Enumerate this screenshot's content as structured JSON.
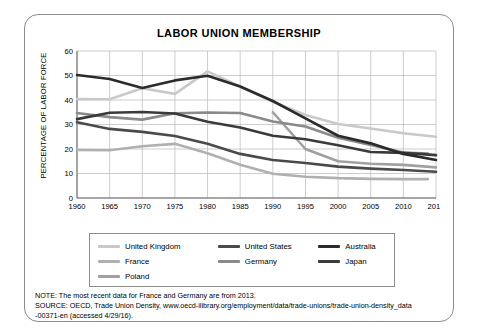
{
  "card": {
    "title": "LABOR UNION MEMBERSHIP"
  },
  "axes": {
    "ylabel": "PERCENTAGE OF LABOR FORCE"
  },
  "legend": {
    "rows": [
      [
        {
          "label": "United Kingdom",
          "color": "#c9c9c9"
        },
        {
          "label": "United States",
          "color": "#4a4a4a"
        },
        {
          "label": "Australia",
          "color": "#2b2b2b"
        }
      ],
      [
        {
          "label": "France",
          "color": "#b0b0b0"
        },
        {
          "label": "Germany",
          "color": "#8a8a8a"
        },
        {
          "label": "Japan",
          "color": "#3a3a3a"
        }
      ],
      [
        {
          "label": "Poland",
          "color": "#a0a0a0"
        }
      ]
    ]
  },
  "notes": {
    "note": "NOTE: The most recent data for France and Germany are from 2013.",
    "source": "SOURCE: OECD, Trade Union Density, www.oecd-ilibrary.org/employment/data/trade-unions/trade-union-density_data",
    "source_cont": "-00371-en (accessed 4/29/16)."
  },
  "chart_data": {
    "type": "line",
    "title": "LABOR UNION MEMBERSHIP",
    "xlabel": "",
    "ylabel": "PERCENTAGE OF LABOR FORCE",
    "xlim": [
      1960,
      2014
    ],
    "ylim": [
      0,
      60
    ],
    "yticks": [
      0,
      10,
      20,
      30,
      40,
      50,
      60
    ],
    "xticks": [
      1960,
      1965,
      1970,
      1975,
      1980,
      1985,
      1990,
      1995,
      2000,
      2005,
      2010,
      2014
    ],
    "grid": true,
    "legend_position": "bottom",
    "series": [
      {
        "name": "United Kingdom",
        "color": "#c9c9c9",
        "x": [
          1960,
          1965,
          1970,
          1975,
          1980,
          1985,
          1990,
          1995,
          2000,
          2005,
          2010,
          2014
        ],
        "values": [
          40.4,
          40.3,
          44.8,
          42.5,
          51.7,
          45.5,
          39.3,
          33.9,
          30.2,
          28.4,
          26.4,
          25.0
        ]
      },
      {
        "name": "United States",
        "color": "#4a4a4a",
        "x": [
          1960,
          1965,
          1970,
          1975,
          1980,
          1985,
          1990,
          1995,
          2000,
          2005,
          2010,
          2014
        ],
        "values": [
          30.9,
          28.2,
          27.0,
          25.3,
          22.1,
          18.0,
          15.5,
          14.3,
          12.8,
          12.0,
          11.4,
          10.7
        ]
      },
      {
        "name": "Australia",
        "color": "#2b2b2b",
        "x": [
          1960,
          1965,
          1970,
          1975,
          1980,
          1985,
          1990,
          1995,
          2000,
          2005,
          2010,
          2014
        ],
        "values": [
          50.2,
          48.6,
          44.9,
          48.0,
          49.9,
          45.5,
          39.6,
          32.5,
          25.4,
          22.3,
          18.0,
          15.5
        ]
      },
      {
        "name": "France",
        "color": "#b0b0b0",
        "x": [
          1960,
          1965,
          1970,
          1975,
          1980,
          1985,
          1990,
          1995,
          2000,
          2005,
          2010,
          2013
        ],
        "values": [
          19.6,
          19.5,
          21.1,
          22.1,
          18.3,
          13.6,
          9.9,
          8.7,
          8.1,
          7.8,
          7.7,
          7.7
        ]
      },
      {
        "name": "Germany",
        "color": "#8a8a8a",
        "x": [
          1960,
          1965,
          1970,
          1975,
          1980,
          1985,
          1990,
          1995,
          2000,
          2005,
          2010,
          2013
        ],
        "values": [
          34.7,
          33.0,
          32.0,
          34.6,
          34.9,
          34.7,
          31.2,
          29.2,
          24.6,
          21.6,
          18.6,
          18.1
        ]
      },
      {
        "name": "Japan",
        "color": "#3a3a3a",
        "x": [
          1960,
          1965,
          1970,
          1975,
          1980,
          1985,
          1990,
          1995,
          2000,
          2005,
          2010,
          2014
        ],
        "values": [
          32.2,
          34.8,
          35.1,
          34.5,
          31.1,
          28.8,
          25.4,
          24.0,
          21.5,
          18.8,
          18.4,
          17.5
        ]
      },
      {
        "name": "Poland",
        "color": "#a0a0a0",
        "x": [
          1990,
          1995,
          2000,
          2005,
          2010,
          2014
        ],
        "values": [
          35.0,
          20.0,
          15.0,
          14.0,
          13.5,
          12.5
        ]
      }
    ]
  }
}
